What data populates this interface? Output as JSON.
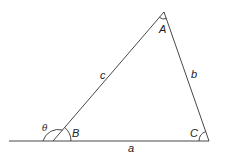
{
  "diagram": {
    "type": "triangle-with-exterior-angle",
    "vertices": [
      {
        "name": "A",
        "label": "A",
        "x": 164,
        "y": 12
      },
      {
        "name": "B",
        "label": "B",
        "x": 53,
        "y": 141
      },
      {
        "name": "C",
        "label": "C",
        "x": 209,
        "y": 141
      }
    ],
    "sides": [
      {
        "name": "a",
        "label": "a",
        "between": [
          "B",
          "C"
        ]
      },
      {
        "name": "b",
        "label": "b",
        "between": [
          "A",
          "C"
        ]
      },
      {
        "name": "c",
        "label": "c",
        "between": [
          "A",
          "B"
        ]
      }
    ],
    "exterior_angle": {
      "label": "θ",
      "at_vertex": "B"
    },
    "baseline_extension": {
      "from_x": 9,
      "to_x": 209,
      "y": 141
    },
    "colors": {
      "stroke": "#333333",
      "text": "#222222",
      "background": "#ffffff"
    }
  }
}
